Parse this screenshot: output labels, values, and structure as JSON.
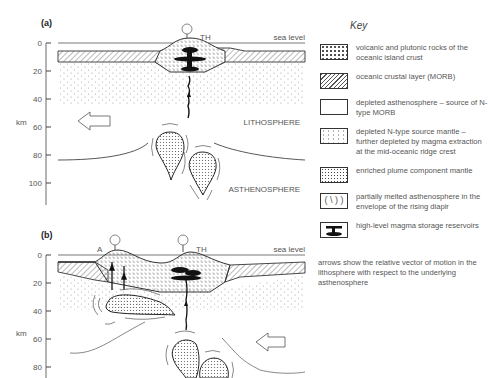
{
  "panels": {
    "a": {
      "label": "(a)",
      "island_label": "TH",
      "sea_level_label": "sea level",
      "lithosphere_label": "LITHOSPHERE",
      "asthenosphere_label": "ASTHENOSPHERE",
      "axis_unit": "km",
      "axis_ticks": [
        "0",
        "20",
        "40",
        "60",
        "80",
        "100"
      ],
      "arrow_direction": "left"
    },
    "b": {
      "label": "(b)",
      "island_labels": [
        "A",
        "TH"
      ],
      "sea_level_label": "sea level",
      "axis_unit": "km",
      "axis_ticks": [
        "0",
        "20",
        "40",
        "60",
        "80"
      ],
      "arrow_direction": "left"
    }
  },
  "key": {
    "title": "Key",
    "items": [
      {
        "pattern": "crosses-dots",
        "text": "volcanic and plutonic rocks of the oceanic island crust"
      },
      {
        "pattern": "hatched",
        "text": "oceanic crustal layer (MORB)"
      },
      {
        "pattern": "blank",
        "text": "depleted asthenosphere – source of N-type MORB"
      },
      {
        "pattern": "sparse-dots",
        "text": "depleted N-type source mantle – further depleted by magma extraction at the mid-oceanic ridge crest"
      },
      {
        "pattern": "dense-dots",
        "text": "enriched plume component mantle"
      },
      {
        "pattern": "brackets",
        "text": "partially melted asthenosphere in the envelope of the rising diapir"
      },
      {
        "pattern": "reservoir",
        "text": "high-level magma storage reservoirs"
      }
    ],
    "note": "arrows show the relative vector of motion in the lithosphere with respect to the underlying asthenosphere"
  }
}
